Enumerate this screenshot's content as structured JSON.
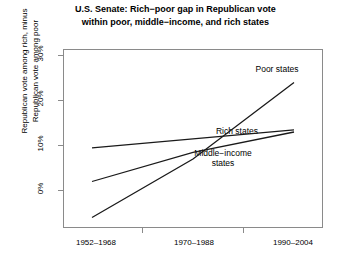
{
  "chart_data": {
    "type": "line",
    "title": "U.S. Senate:  Rich−poor gap in Republican vote within poor, middle−income, and rich states",
    "title_line1": "U.S. Senate:  Rich−poor gap in Republican vote",
    "title_line2": "within poor, middle−income, and rich states",
    "xlabel": "",
    "ylabel": "Republican vote among rich, minus Republican vote among poor",
    "ylabel_line1": "Republican vote among rich, minus",
    "ylabel_line2": "Republican vote among poor",
    "categories": [
      "1952–1968",
      "1970–1988",
      "1990–2004"
    ],
    "x": [
      1,
      2,
      3
    ],
    "ylim": [
      -8,
      32
    ],
    "yticks": [
      0,
      10,
      20,
      30
    ],
    "ytick_labels": [
      "0%",
      "10%",
      "20%",
      "30%"
    ],
    "grid": false,
    "legend_position": "inline-annotations",
    "series": [
      {
        "name": "Poor states",
        "label": "Poor states",
        "values": [
          -6.0,
          7.0,
          24.0
        ],
        "color": "#1a1a1a"
      },
      {
        "name": "Middle-income states",
        "label": "Middle−income states",
        "label_line1": "Middle−income",
        "label_line2": "states",
        "values": [
          2.0,
          8.5,
          13.0
        ],
        "color": "#1a1a1a"
      },
      {
        "name": "Rich states",
        "label": "Rich states",
        "values": [
          9.5,
          11.5,
          13.5
        ],
        "color": "#1a1a1a"
      }
    ]
  },
  "axes": {
    "ytick_0": "0%",
    "ytick_1": "10%",
    "ytick_2": "20%",
    "ytick_3": "30%",
    "xtick_0": "1952–1968",
    "xtick_1": "1970–1988",
    "xtick_2": "1990–2004"
  },
  "annotations": {
    "poor": "Poor states",
    "rich": "Rich states",
    "middle_1": "Middle−income",
    "middle_2": "states"
  },
  "style": {
    "frame_color": "#8a8a8a",
    "line_color": "#1a1a1a",
    "text_color": "#000000"
  }
}
